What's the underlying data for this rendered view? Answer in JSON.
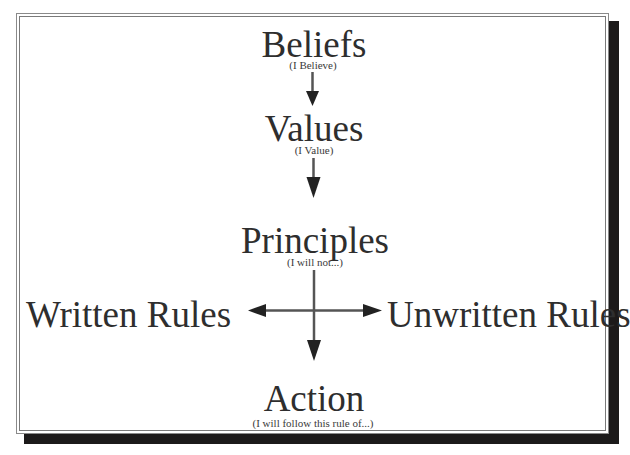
{
  "diagram": {
    "type": "flow",
    "frame": {
      "border_color": "#8a8a8a",
      "shadow_color": "#1c1a1a",
      "background": "#ffffff"
    },
    "nodes": [
      {
        "id": "beliefs",
        "title": "Beliefs",
        "subtitle": "(I Believe)"
      },
      {
        "id": "values",
        "title": "Values",
        "subtitle": "(I Value)"
      },
      {
        "id": "principles",
        "title": "Principles",
        "subtitle": "(I will not...)"
      },
      {
        "id": "written_rules",
        "title": "Written Rules"
      },
      {
        "id": "unwritten_rules",
        "title": "Unwritten Rules"
      },
      {
        "id": "action",
        "title": "Action",
        "subtitle": "(I will follow this rule of...)"
      }
    ],
    "edges": [
      {
        "from": "beliefs",
        "to": "values"
      },
      {
        "from": "values",
        "to": "principles"
      },
      {
        "from": "principles",
        "to": "written_rules"
      },
      {
        "from": "principles",
        "to": "unwritten_rules"
      },
      {
        "from": "principles",
        "to": "action"
      }
    ],
    "arrow_color": "#2a2a2a"
  }
}
